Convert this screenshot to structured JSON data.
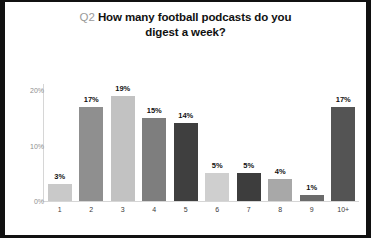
{
  "chart_data": {
    "type": "bar",
    "title_prefix": "Q2",
    "title_main": "How many football podcasts do you digest a week?",
    "title_line1": "How many football podcasts do you",
    "title_line2": "digest a week?",
    "xlabel": "",
    "ylabel": "",
    "categories": [
      "1",
      "2",
      "3",
      "4",
      "5",
      "6",
      "7",
      "8",
      "9",
      "10+"
    ],
    "values": [
      3,
      17,
      19,
      15,
      14,
      5,
      5,
      4,
      1,
      17
    ],
    "value_labels": [
      "3%",
      "17%",
      "19%",
      "15%",
      "14%",
      "5%",
      "5%",
      "4%",
      "1%",
      "17%"
    ],
    "bar_colors": [
      "#c9c9c9",
      "#8f8f8f",
      "#c2c2c2",
      "#7e7e7e",
      "#3f3f3f",
      "#cfcfcf",
      "#3d3d3d",
      "#a8a8a8",
      "#6b6b6b",
      "#545454"
    ],
    "ylim": [
      0,
      22
    ],
    "yticks": [
      0,
      10,
      20
    ],
    "ytick_labels": [
      "0%",
      "10%",
      "20%"
    ],
    "grid": false,
    "legend": null,
    "axis_color": "#d6d6d6",
    "tick_label_color": "#8d8d8d",
    "title_prefix_color": "#9a9a9a",
    "title_color": "#111111",
    "frame_color": "#111111",
    "background": "#ffffff"
  }
}
